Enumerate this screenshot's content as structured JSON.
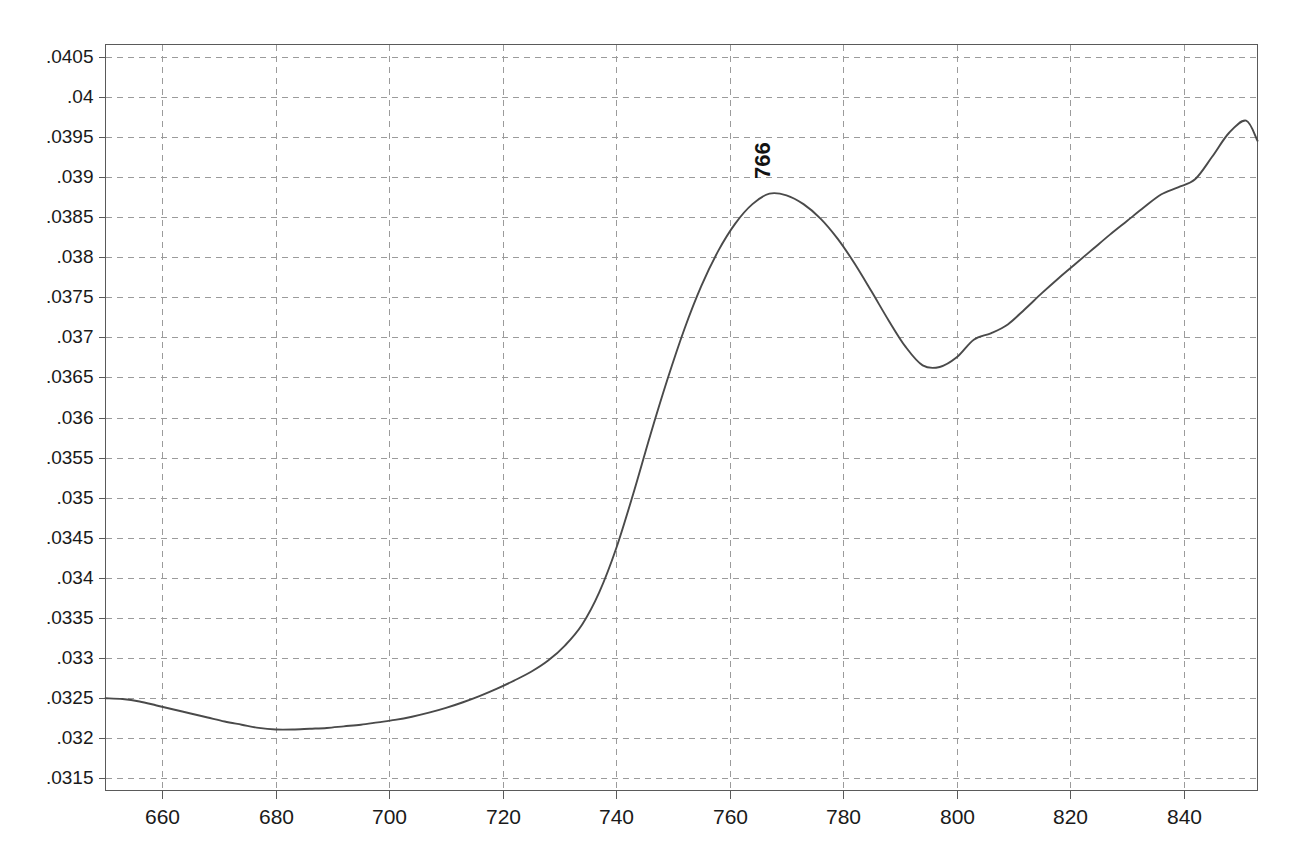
{
  "chart_data": {
    "type": "line",
    "title": "",
    "subtitle": "",
    "xlabel": "",
    "ylabel": "",
    "xlim": [
      650,
      853
    ],
    "ylim": [
      0.03135,
      0.04065
    ],
    "grid": true,
    "legend": false,
    "legend_position": "none",
    "line_color": "#4a4a4a",
    "grid_color": "#9b9b9b",
    "axis_color": "#5a5a5a",
    "background_color": "#ffffff",
    "xticks": [
      660,
      680,
      700,
      720,
      740,
      760,
      780,
      800,
      820,
      840
    ],
    "xtick_labels": [
      "660",
      "680",
      "700",
      "720",
      "740",
      "760",
      "780",
      "800",
      "820",
      "840"
    ],
    "yticks": [
      0.0315,
      0.032,
      0.0325,
      0.033,
      0.0335,
      0.034,
      0.0345,
      0.035,
      0.0355,
      0.036,
      0.0365,
      0.037,
      0.0375,
      0.038,
      0.0385,
      0.039,
      0.0395,
      0.04,
      0.0405
    ],
    "ytick_labels": [
      ".0315",
      ".032",
      ".0325",
      ".033",
      ".0335",
      ".034",
      ".0345",
      ".035",
      ".0355",
      ".036",
      ".0365",
      ".037",
      ".0375",
      ".038",
      ".0385",
      ".039",
      ".0395",
      ".04",
      ".0405"
    ],
    "annotations": [
      {
        "text": "766",
        "x": 766,
        "y": 0.0388,
        "rotation": -90
      }
    ],
    "series": [
      {
        "name": "absorbance",
        "x": [
          650,
          653,
          656,
          659,
          662,
          665,
          668,
          671,
          674,
          677,
          680,
          683,
          686,
          689,
          692,
          695,
          698,
          701,
          704,
          707,
          710,
          713,
          716,
          719,
          722,
          725,
          728,
          731,
          734,
          737,
          740,
          743,
          746,
          749,
          752,
          755,
          758,
          761,
          764,
          767,
          770,
          773,
          776,
          779,
          782,
          785,
          788,
          791,
          794,
          797,
          800,
          803,
          806,
          809,
          812,
          815,
          818,
          821,
          824,
          827,
          830,
          833,
          836,
          839,
          842,
          845,
          848,
          851,
          853
        ],
        "values": [
          0.0325,
          0.03249,
          0.03246,
          0.03241,
          0.03236,
          0.03231,
          0.03226,
          0.03221,
          0.03217,
          0.03213,
          0.03211,
          0.03211,
          0.03212,
          0.03213,
          0.03215,
          0.03217,
          0.0322,
          0.03223,
          0.03227,
          0.03232,
          0.03238,
          0.03245,
          0.03253,
          0.03262,
          0.03272,
          0.03283,
          0.03297,
          0.03316,
          0.03342,
          0.03382,
          0.03437,
          0.03505,
          0.03578,
          0.03647,
          0.0371,
          0.03764,
          0.03808,
          0.03842,
          0.03866,
          0.03879,
          0.03877,
          0.03866,
          0.03848,
          0.03823,
          0.03792,
          0.03757,
          0.03721,
          0.03688,
          0.03665,
          0.03663,
          0.03675,
          0.03697,
          0.03705,
          0.03716,
          0.03735,
          0.03755,
          0.03774,
          0.03792,
          0.0381,
          0.03828,
          0.03845,
          0.03862,
          0.03878,
          0.03887,
          0.03897,
          0.03925,
          0.03955,
          0.0397,
          0.03945
        ]
      }
    ]
  },
  "peak": {
    "label": "766"
  }
}
